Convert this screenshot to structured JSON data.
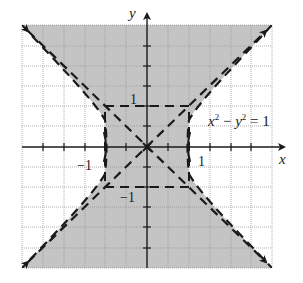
{
  "figure": {
    "equation_label": "x² − y² = 1",
    "equation_parts": {
      "x": "x",
      "x_exp": "2",
      "minus": " − ",
      "y": "y",
      "y_exp": "2",
      "rhs": " = 1"
    },
    "axis_x_label": "x",
    "axis_y_label": "y",
    "tick_labels": {
      "x_pos": "1",
      "x_neg": "−1",
      "y_pos": "1",
      "y_neg": "−1"
    },
    "shading_color": "#c4c4c4",
    "grid_color": "#9a9a9a",
    "line_color": "#1a1a1a",
    "x_range": [
      -3,
      3
    ],
    "y_range": [
      -3,
      3
    ],
    "asymptotes": [
      "y = x",
      "y = -x"
    ],
    "shaded_region": "x² − y² < 1"
  }
}
